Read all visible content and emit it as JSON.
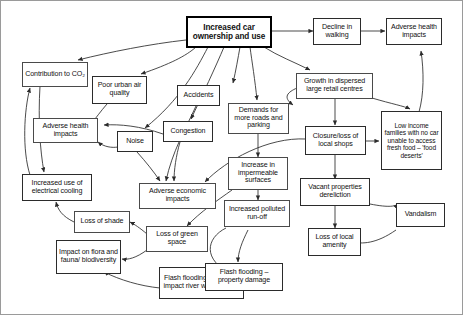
{
  "diagram": {
    "type": "concept-map",
    "stroke_color": "#2b2b2b",
    "background_color": "#ffffff",
    "root_border_color": "#000000"
  },
  "nodes": [
    {
      "id": "root",
      "label": "Increased car ownership and use"
    },
    {
      "id": "co2",
      "label": "Contribution to CO₂"
    },
    {
      "id": "air",
      "label": "Poor urban air quality"
    },
    {
      "id": "accidents",
      "label": "Accidents"
    },
    {
      "id": "congestion",
      "label": "Congestion"
    },
    {
      "id": "noise",
      "label": "Noise"
    },
    {
      "id": "health_left",
      "label": "Adverse health impacts"
    },
    {
      "id": "demands",
      "label": "Demands for more roads and parking"
    },
    {
      "id": "decline_walk",
      "label": "Decline in walking"
    },
    {
      "id": "health_right",
      "label": "Adverse health impacts"
    },
    {
      "id": "growth_retail",
      "label": "Growth in dispersed large retail centres"
    },
    {
      "id": "closure",
      "label": "Closure/loss of local shops"
    },
    {
      "id": "low_income",
      "label": "Low income families with no car unable to access fresh food – 'food deserts'"
    },
    {
      "id": "cooling",
      "label": "Increased use of electrical cooling"
    },
    {
      "id": "loss_shade",
      "label": "Loss of shade"
    },
    {
      "id": "economic",
      "label": "Adverse economic impacts"
    },
    {
      "id": "impermeable",
      "label": "Increase in impermeable surfaces"
    },
    {
      "id": "runoff",
      "label": "Increased polluted run-off"
    },
    {
      "id": "vacant",
      "label": "Vacant properties dereliction"
    },
    {
      "id": "vandalism",
      "label": "Vandalism"
    },
    {
      "id": "loss_amenity",
      "label": "Loss of local amenity"
    },
    {
      "id": "green_space",
      "label": "Loss of green space"
    },
    {
      "id": "flora",
      "label": "Impact on flora and fauna/ biodiversity"
    },
    {
      "id": "flood_river",
      "label": "Flash flooding – adverse impact river water quality"
    },
    {
      "id": "flood_property",
      "label": "Flash flooding – property damage"
    }
  ],
  "edges": [
    {
      "from": "root",
      "to": "co2"
    },
    {
      "from": "root",
      "to": "air"
    },
    {
      "from": "root",
      "to": "accidents"
    },
    {
      "from": "root",
      "to": "congestion"
    },
    {
      "from": "root",
      "to": "noise"
    },
    {
      "from": "root",
      "to": "demands"
    },
    {
      "from": "root",
      "to": "decline_walk"
    },
    {
      "from": "root",
      "to": "growth_retail"
    },
    {
      "from": "air",
      "to": "health_left"
    },
    {
      "from": "noise",
      "to": "health_left"
    },
    {
      "from": "congestion",
      "to": "health_left"
    },
    {
      "from": "decline_walk",
      "to": "health_right"
    },
    {
      "from": "low_income",
      "to": "health_right"
    },
    {
      "from": "growth_retail",
      "to": "closure"
    },
    {
      "from": "growth_retail",
      "to": "low_income"
    },
    {
      "from": "growth_retail",
      "to": "demands"
    },
    {
      "from": "closure",
      "to": "low_income"
    },
    {
      "from": "closure",
      "to": "economic"
    },
    {
      "from": "closure",
      "to": "vacant"
    },
    {
      "from": "congestion",
      "to": "economic"
    },
    {
      "from": "accidents",
      "to": "economic"
    },
    {
      "from": "demands",
      "to": "impermeable"
    },
    {
      "from": "impermeable",
      "to": "runoff"
    },
    {
      "from": "impermeable",
      "to": "green_space"
    },
    {
      "from": "runoff",
      "to": "flood_property"
    },
    {
      "from": "runoff",
      "to": "flood_river"
    },
    {
      "from": "vacant",
      "to": "loss_amenity"
    },
    {
      "from": "vandalism",
      "to": "loss_amenity"
    },
    {
      "from": "vacant",
      "to": "vandalism"
    },
    {
      "from": "co2",
      "to": "cooling"
    },
    {
      "from": "cooling",
      "to": "co2"
    },
    {
      "from": "loss_shade",
      "to": "cooling"
    },
    {
      "from": "green_space",
      "to": "loss_shade"
    },
    {
      "from": "green_space",
      "to": "flora"
    },
    {
      "from": "flood_river",
      "to": "flora"
    }
  ]
}
